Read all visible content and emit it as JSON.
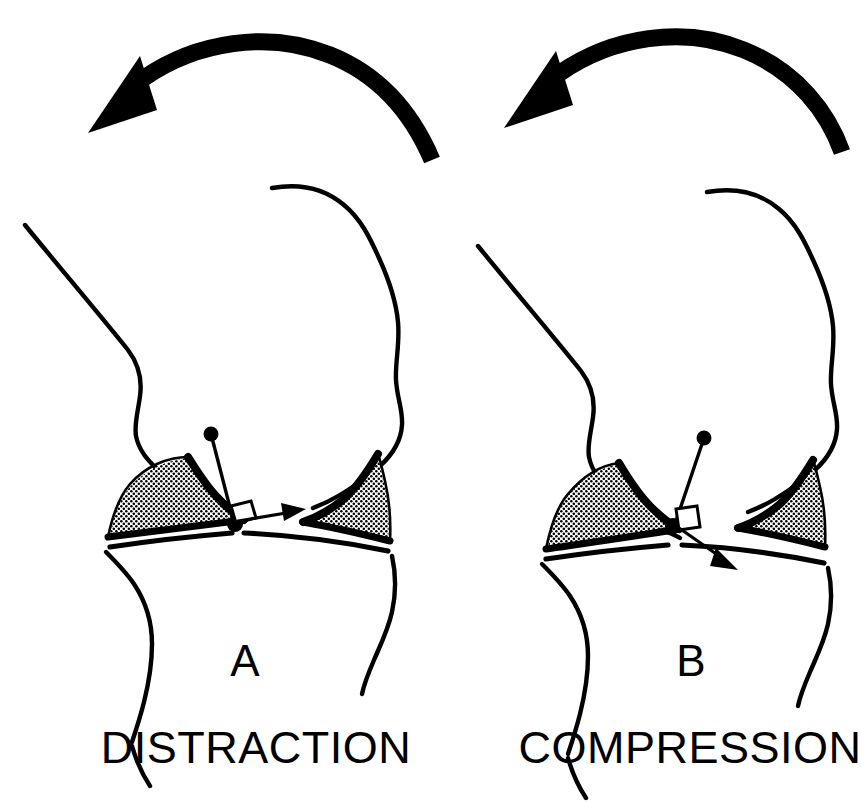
{
  "figure": {
    "background_color": "#ffffff",
    "ink_color": "#000000",
    "width": 861,
    "height": 802
  },
  "panels": [
    {
      "id": "A",
      "letter": "A",
      "caption": "DISTRACTION",
      "rotation_arrow": {
        "name": "rotation-arrow",
        "direction": "counterclockwise-to-left",
        "description": "thick curved arrow sweeping right-to-left over the joint"
      },
      "force_vector": {
        "name": "force-vector",
        "description": "arrow directed horizontally outward from the tibial pivot point",
        "direction": "lateral-horizontal",
        "effect": "joint surfaces pulled apart"
      },
      "markers": {
        "pivot_dot": "contact-point",
        "origin_dot": "force-origin",
        "right_angle_square": "perpendicular-marker"
      },
      "menisci": [
        {
          "side": "left",
          "fill": "stipple"
        },
        {
          "side": "right",
          "fill": "stipple"
        }
      ],
      "bones": [
        {
          "name": "femur",
          "position": "upper"
        },
        {
          "name": "tibia",
          "position": "lower"
        }
      ]
    },
    {
      "id": "B",
      "letter": "B",
      "caption": "COMPRESSION",
      "rotation_arrow": {
        "name": "rotation-arrow",
        "direction": "counterclockwise-to-left",
        "description": "thick curved arrow sweeping right-to-left over the joint"
      },
      "force_vector": {
        "name": "force-vector",
        "description": "arrow directed downward and outward from the tibial pivot point",
        "direction": "inferolateral-oblique",
        "effect": "joint surfaces pressed together"
      },
      "markers": {
        "pivot_dot": "contact-point",
        "origin_dot": "force-origin",
        "right_angle_square": "perpendicular-marker"
      },
      "menisci": [
        {
          "side": "left",
          "fill": "stipple"
        },
        {
          "side": "right",
          "fill": "stipple"
        }
      ],
      "bones": [
        {
          "name": "femur",
          "position": "upper"
        },
        {
          "name": "tibia",
          "position": "lower"
        }
      ]
    }
  ]
}
